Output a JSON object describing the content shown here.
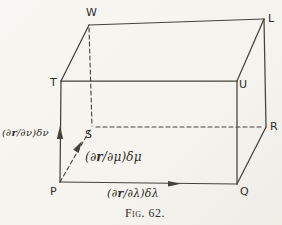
{
  "figure": {
    "caption": "Fig. 62.",
    "vertices": {
      "W": "W",
      "L": "L",
      "T": "T",
      "U": "U",
      "S": "S",
      "R": "R",
      "P": "P",
      "Q": "Q"
    },
    "edge_labels": {
      "nu": {
        "pre": "(∂",
        "vec": "r",
        "post": "/∂ν)δν"
      },
      "mu": {
        "pre": "(∂",
        "vec": "r",
        "post": "/∂μ)δμ"
      },
      "lambda": {
        "pre": "(∂",
        "vec": "r",
        "post": "/∂λ)δλ"
      }
    },
    "colors": {
      "line": "#45423b",
      "text": "#2f2d28",
      "background": "#f6f4ef"
    }
  }
}
